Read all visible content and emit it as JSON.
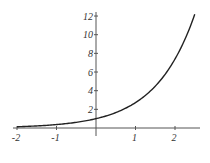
{
  "chart_data": {
    "type": "line",
    "title": "",
    "xlabel": "",
    "ylabel": "",
    "function": "y = e^x",
    "xlim": [
      -2,
      2.5
    ],
    "ylim": [
      0,
      12.2
    ],
    "x_ticks": [
      -2,
      -1,
      1,
      2
    ],
    "y_ticks": [
      2,
      4,
      6,
      8,
      10,
      12
    ],
    "grid": false,
    "legend": null,
    "series": [
      {
        "name": "e^x",
        "color": "#222222",
        "x": [
          -2,
          -1.5,
          -1,
          -0.5,
          0,
          0.5,
          1,
          1.5,
          2,
          2.5
        ],
        "y": [
          0.14,
          0.22,
          0.37,
          0.61,
          1.0,
          1.65,
          2.72,
          4.48,
          7.39,
          12.18
        ]
      }
    ]
  },
  "colors": {
    "axis": "#555555",
    "curve": "#222222",
    "text": "#333333"
  }
}
